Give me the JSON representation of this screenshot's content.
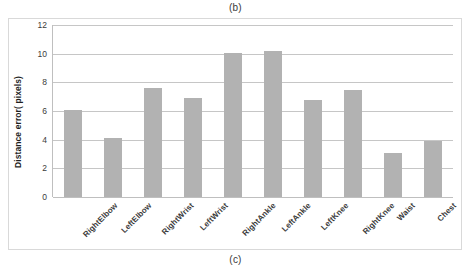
{
  "figure": {
    "caption_top": "(b)",
    "caption_bottom": "(c)"
  },
  "chart_data": {
    "type": "bar",
    "title": "",
    "xlabel": "",
    "ylabel": "Distance error( pixels)",
    "categories": [
      "RightElbow",
      "LeftElbow",
      "RightWrist",
      "LeftWrist",
      "RightAnkle",
      "LeftAnkle",
      "LeftKnee",
      "RightKnee",
      "Waist",
      "Chest"
    ],
    "values": [
      6.05,
      4.1,
      7.6,
      6.9,
      10.05,
      10.2,
      6.75,
      7.5,
      3.1,
      3.9
    ],
    "ylim": [
      0,
      12
    ],
    "yticks": [
      0,
      2,
      4,
      6,
      8,
      10,
      12
    ],
    "ytick_labels": [
      "0",
      "2",
      "4",
      "6",
      "8",
      "10",
      "12"
    ],
    "grid": true,
    "legend": "none",
    "bar_color": "#b2b2b2",
    "gridline_color": "#c6c6c6",
    "plot_background": "#ffffff"
  }
}
